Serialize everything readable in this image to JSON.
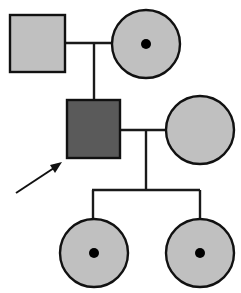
{
  "diagram": {
    "type": "pedigree",
    "colors": {
      "unaffected_fill": "#c0c0c0",
      "affected_fill": "#5a5a5a",
      "outline": "#111111",
      "carrier_dot": "#000000",
      "background": "#ffffff"
    },
    "individuals": [
      {
        "id": "I-1",
        "sex": "male",
        "status": "unaffected",
        "generation": 1,
        "role": "grandfather"
      },
      {
        "id": "I-2",
        "sex": "female",
        "status": "carrier",
        "generation": 1,
        "role": "grandmother"
      },
      {
        "id": "II-1",
        "sex": "male",
        "status": "affected",
        "generation": 2,
        "role": "proband",
        "proband_arrow": true
      },
      {
        "id": "II-2",
        "sex": "female",
        "status": "unaffected",
        "generation": 2,
        "role": "spouse"
      },
      {
        "id": "III-1",
        "sex": "female",
        "status": "carrier",
        "generation": 3,
        "role": "daughter"
      },
      {
        "id": "III-2",
        "sex": "female",
        "status": "carrier",
        "generation": 3,
        "role": "daughter"
      }
    ],
    "relationships": [
      {
        "type": "mating",
        "partners": [
          "I-1",
          "I-2"
        ],
        "children": [
          "II-1"
        ]
      },
      {
        "type": "mating",
        "partners": [
          "II-1",
          "II-2"
        ],
        "children": [
          "III-1",
          "III-2"
        ]
      }
    ]
  }
}
